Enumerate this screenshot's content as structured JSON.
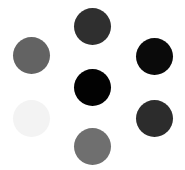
{
  "canvas": {
    "width": 185,
    "height": 170,
    "background": "#ffffff"
  },
  "dots": [
    {
      "position": "top",
      "cx": 92,
      "cy": 26,
      "r": 18.5,
      "color": "#2f2f2f"
    },
    {
      "position": "upper-left",
      "cx": 31,
      "cy": 55,
      "r": 18.5,
      "color": "#636363"
    },
    {
      "position": "upper-right",
      "cx": 154,
      "cy": 56,
      "r": 18.5,
      "color": "#0a0a0a"
    },
    {
      "position": "center",
      "cx": 92,
      "cy": 87,
      "r": 18.5,
      "color": "#020202"
    },
    {
      "position": "lower-left",
      "cx": 31,
      "cy": 118,
      "r": 18.5,
      "color": "#f3f3f3"
    },
    {
      "position": "lower-right",
      "cx": 154,
      "cy": 118,
      "r": 18.5,
      "color": "#2c2c2c"
    },
    {
      "position": "bottom",
      "cx": 92,
      "cy": 146,
      "r": 18.5,
      "color": "#6f6f6f"
    }
  ]
}
